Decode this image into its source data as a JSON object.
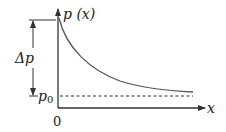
{
  "diagram": {
    "type": "pressure-decay-graph",
    "y_axis_label": "p (x)",
    "x_axis_label": "x",
    "origin_label": "0",
    "baseline_label_main": "p",
    "baseline_label_sub": "0",
    "delta_label": "Δp",
    "curve": "exponential decay from p0+Δp at x=0 asymptotically to p0",
    "colors": {
      "axis": "#333333",
      "curve": "#555555",
      "dashed": "#333333",
      "text": "#222222"
    }
  }
}
